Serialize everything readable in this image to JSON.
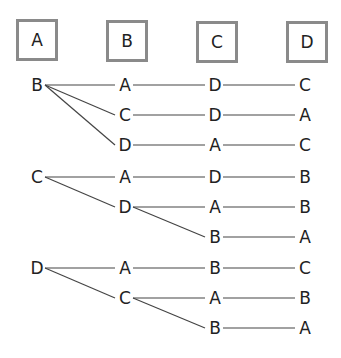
{
  "header_boxes": [
    {
      "label": "A",
      "x": 16,
      "y": 19
    },
    {
      "label": "B",
      "x": 106,
      "y": 20
    },
    {
      "label": "C",
      "x": 196,
      "y": 21
    },
    {
      "label": "D",
      "x": 286,
      "y": 21
    }
  ],
  "tree": {
    "columns_x": [
      37,
      125,
      215,
      305
    ],
    "rows_y": [
      85,
      115,
      145,
      177,
      207,
      237,
      268,
      298,
      328
    ],
    "paths": [
      [
        "B",
        "A",
        "D",
        "C"
      ],
      [
        "B",
        "C",
        "D",
        "A"
      ],
      [
        "B",
        "D",
        "A",
        "C"
      ],
      [
        "C",
        "A",
        "D",
        "B"
      ],
      [
        "C",
        "D",
        "A",
        "B"
      ],
      [
        "C",
        "D",
        "B",
        "A"
      ],
      [
        "D",
        "A",
        "B",
        "C"
      ],
      [
        "D",
        "C",
        "A",
        "B"
      ],
      [
        "D",
        "C",
        "B",
        "A"
      ]
    ]
  },
  "colors": {
    "line": "#444444",
    "box_border": "#8a8a8a",
    "text": "#222222"
  }
}
